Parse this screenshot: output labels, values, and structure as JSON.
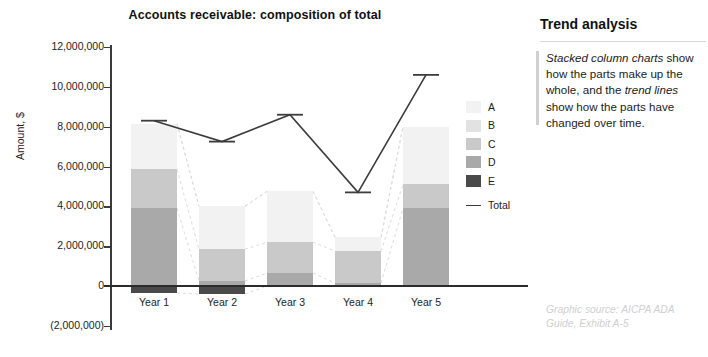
{
  "chart_data": {
    "type": "bar",
    "subtype": "stacked-column-with-trend-line",
    "title": "Accounts receivable: composition of total",
    "xlabel": "",
    "ylabel": "Amount, $",
    "categories": [
      "Year 1",
      "Year 2",
      "Year 3",
      "Year 4",
      "Year 5"
    ],
    "ylim": [
      -2000000,
      12000000
    ],
    "ytick_values": [
      -2000000,
      0,
      2000000,
      4000000,
      6000000,
      8000000,
      10000000,
      12000000
    ],
    "ytick_labels": [
      "(2,000,000)",
      "0",
      "2,000,000",
      "4,000,000",
      "6,000,000",
      "8,000,000",
      "10,000,000",
      "12,000,000"
    ],
    "grid": false,
    "legend_position": "right",
    "series": [
      {
        "name": "A",
        "color": "#f2f2f2",
        "values": [
          2300000,
          2150000,
          2550000,
          700000,
          2900000
        ]
      },
      {
        "name": "B",
        "color": "#e2e2e2",
        "values": [
          0,
          0,
          0,
          0,
          0
        ]
      },
      {
        "name": "C",
        "color": "#c9c9c9",
        "values": [
          1950000,
          1600000,
          1550000,
          1600000,
          1200000
        ]
      },
      {
        "name": "D",
        "color": "#a9a9a9",
        "values": [
          3900000,
          250000,
          650000,
          150000,
          3900000
        ]
      },
      {
        "name": "E",
        "color": "#4a4a4a",
        "values": [
          -350000,
          -400000,
          0,
          0,
          0
        ]
      }
    ],
    "trend_line": {
      "name": "Total",
      "color": "#3c3c3c",
      "values": [
        8300000,
        7250000,
        8600000,
        4700000,
        10600000
      ]
    },
    "connector_lines": {
      "style": "dashed",
      "color": "#dcdcdc",
      "description": "dashed connectors joining matching segment boundaries between adjacent columns"
    }
  },
  "legend": {
    "items": [
      {
        "label": "A",
        "color": "#f2f2f2"
      },
      {
        "label": "B",
        "color": "#e2e2e2"
      },
      {
        "label": "C",
        "color": "#c9c9c9"
      },
      {
        "label": "D",
        "color": "#a9a9a9"
      },
      {
        "label": "E",
        "color": "#4a4a4a"
      }
    ],
    "total_label": "Total"
  },
  "sidebar": {
    "title": "Trend analysis",
    "body_html": "<i>Stacked column charts</i> show how the parts make up the whole, and the <i>trend lines</i> show how the parts have changed over time.",
    "source_note": "Graphic source: AICPA ADA Guide, Exhibit A-5"
  }
}
